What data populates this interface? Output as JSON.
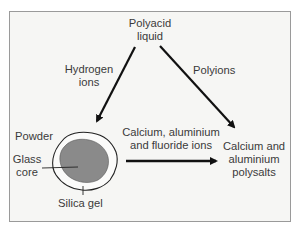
{
  "diagram": {
    "nodes": {
      "polyacid": {
        "line1": "Polyacid",
        "line2": "liquid"
      },
      "powder": {
        "label": "Powder"
      },
      "glass_core": {
        "line1": "Glass",
        "line2": "core"
      },
      "silica_gel": {
        "label": "Silica gel"
      },
      "polysalts": {
        "line1": "Calcium and",
        "line2": "aluminium",
        "line3": "polysalts"
      }
    },
    "edges": {
      "hydrogen_ions": {
        "line1": "Hydrogen",
        "line2": "ions",
        "from": "Polyacid liquid",
        "to": "Powder"
      },
      "polyions": {
        "label": "Polyions",
        "from": "Polyacid liquid",
        "to": "Calcium and aluminium polysalts"
      },
      "metal_ions": {
        "line1": "Calcium, aluminium",
        "line2": "and fluoride ions",
        "from": "Powder",
        "to": "Calcium and aluminium polysalts"
      }
    },
    "colors": {
      "background": "#f6f6f4",
      "border": "#9a9a9a",
      "text": "#3a3a3a",
      "arrow": "#111111",
      "core_fill": "#8a8a8a",
      "particle_outline": "#222222"
    }
  }
}
